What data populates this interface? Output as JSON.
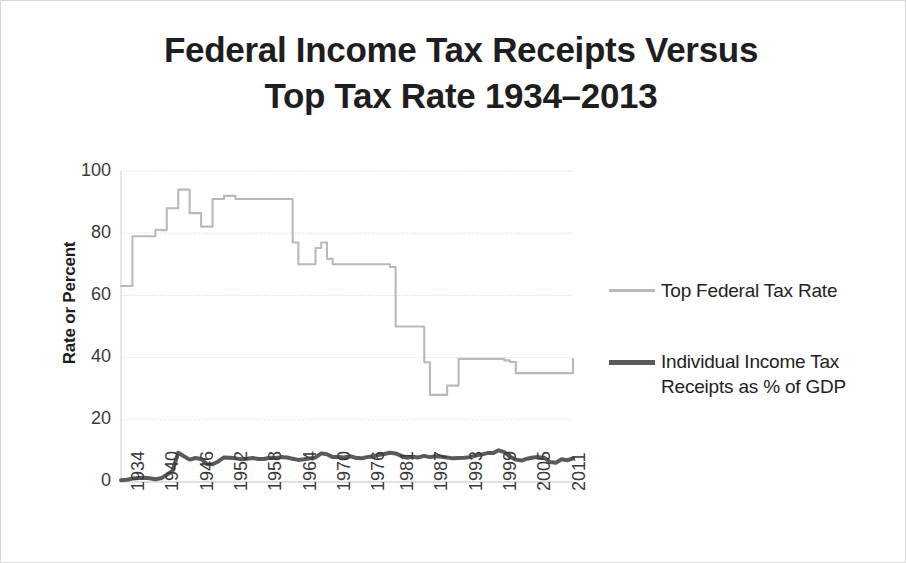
{
  "figure": {
    "title": "Federal Income Tax Receipts Versus\nTop Tax Rate 1934–2013",
    "border_color": "#d8d8d8",
    "background": "#ffffff"
  },
  "axes": {
    "y_axis_title": "Rate or Percent",
    "y_ticks": [
      "100",
      "80",
      "60",
      "40",
      "20",
      "0"
    ],
    "x_ticks": [
      "1934",
      "1940",
      "1946",
      "1952",
      "1958",
      "1964",
      "1970",
      "1976",
      "1981",
      "1987",
      "1993",
      "1999",
      "2005",
      "2011"
    ]
  },
  "legend": {
    "items": [
      {
        "label": "Top Federal Tax Rate",
        "color": "#b9b9b9",
        "style": "thin-light-gray-line"
      },
      {
        "label": "Individual Income Tax Receipts as % of GDP",
        "color": "#5a5a5a",
        "style": "thick-dark-gray-line"
      }
    ]
  },
  "chart_data": {
    "type": "line",
    "title": "Federal Income Tax Receipts Versus Top Tax Rate 1934–2013",
    "xlabel": "",
    "ylabel": "Rate or Percent",
    "ylim": [
      0,
      100
    ],
    "xlim": [
      1934,
      2013
    ],
    "grid": true,
    "legend_position": "right",
    "x": [
      1934,
      1935,
      1936,
      1937,
      1938,
      1939,
      1940,
      1941,
      1942,
      1943,
      1944,
      1945,
      1946,
      1947,
      1948,
      1949,
      1950,
      1951,
      1952,
      1953,
      1954,
      1955,
      1956,
      1957,
      1958,
      1959,
      1960,
      1961,
      1962,
      1963,
      1964,
      1965,
      1966,
      1967,
      1968,
      1969,
      1970,
      1971,
      1972,
      1973,
      1974,
      1975,
      1976,
      1977,
      1978,
      1979,
      1980,
      1981,
      1982,
      1983,
      1984,
      1985,
      1986,
      1987,
      1988,
      1989,
      1990,
      1991,
      1992,
      1993,
      1994,
      1995,
      1996,
      1997,
      1998,
      1999,
      2000,
      2001,
      2002,
      2003,
      2004,
      2005,
      2006,
      2007,
      2008,
      2009,
      2010,
      2011,
      2012,
      2013
    ],
    "series": [
      {
        "name": "Top Federal Tax Rate",
        "color": "#b9b9b9",
        "unit": "percent",
        "values": [
          63,
          63,
          79,
          79,
          79,
          79,
          81.1,
          81,
          88,
          88,
          94,
          94,
          86.45,
          86.45,
          82.13,
          82.13,
          91,
          91,
          92,
          92,
          91,
          91,
          91,
          91,
          91,
          91,
          91,
          91,
          91,
          91,
          77,
          70,
          70,
          70,
          75.25,
          77,
          71.75,
          70,
          70,
          70,
          70,
          70,
          70,
          70,
          70,
          70,
          70,
          69.125,
          50,
          50,
          50,
          50,
          50,
          38.5,
          28,
          28,
          28,
          31,
          31,
          39.6,
          39.6,
          39.6,
          39.6,
          39.6,
          39.6,
          39.6,
          39.6,
          39.1,
          38.6,
          35,
          35,
          35,
          35,
          35,
          35,
          35,
          35,
          35,
          35,
          39.6
        ]
      },
      {
        "name": "Individual Income Tax Receipts as % of GDP",
        "color": "#5a5a5a",
        "unit": "percent of GDP",
        "values": [
          0.6,
          0.7,
          1.1,
          1.3,
          1.4,
          1.2,
          0.9,
          1.2,
          2.3,
          3.6,
          9.4,
          8.3,
          7.2,
          7.7,
          7.4,
          5.8,
          5.7,
          6.6,
          7.9,
          7.8,
          7.6,
          7.3,
          7.5,
          7.7,
          7.4,
          7.4,
          7.8,
          7.7,
          8.0,
          7.9,
          7.5,
          7.1,
          7.3,
          7.6,
          7.9,
          9.2,
          8.9,
          8.0,
          8.0,
          7.9,
          8.3,
          7.8,
          7.6,
          8.0,
          8.2,
          8.7,
          9.0,
          9.4,
          9.2,
          8.4,
          7.8,
          8.1,
          7.9,
          8.4,
          8.0,
          8.3,
          8.1,
          7.9,
          7.6,
          7.7,
          7.8,
          8.0,
          8.5,
          8.8,
          9.3,
          9.3,
          10.2,
          9.6,
          8.1,
          7.2,
          6.9,
          7.5,
          7.9,
          8.0,
          7.8,
          6.4,
          6.2,
          7.3,
          7.0,
          7.6
        ]
      }
    ]
  }
}
